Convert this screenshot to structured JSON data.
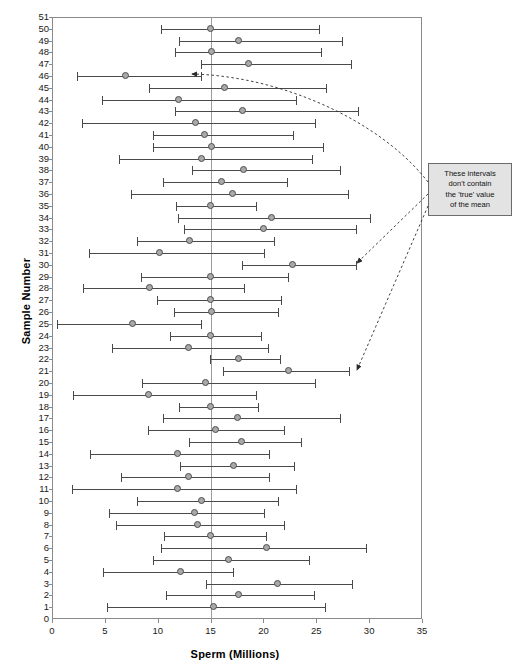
{
  "chart_data": {
    "type": "scatter",
    "title": "",
    "xlabel": "Sperm (Millions)",
    "ylabel": "Sample Number",
    "xlim": [
      0,
      35
    ],
    "ylim": [
      0,
      51
    ],
    "xticks": [
      0,
      5,
      10,
      15,
      20,
      25,
      30,
      35
    ],
    "yticks": [
      0,
      1,
      2,
      3,
      4,
      5,
      6,
      7,
      8,
      9,
      10,
      11,
      12,
      13,
      14,
      15,
      16,
      17,
      18,
      19,
      20,
      21,
      22,
      23,
      24,
      25,
      26,
      27,
      28,
      29,
      30,
      31,
      32,
      33,
      34,
      35,
      36,
      37,
      38,
      39,
      40,
      41,
      42,
      43,
      44,
      45,
      46,
      47,
      48,
      49,
      50,
      51
    ],
    "grid": false,
    "legend": null,
    "reference_line": {
      "orientation": "vertical",
      "value": 15,
      "label": "true mean"
    },
    "series": [
      {
        "name": "95% confidence interval of the mean",
        "marker": "circle",
        "points": [
          {
            "sample": 50,
            "mean": 15.0,
            "low": 10.3,
            "high": 25.3
          },
          {
            "sample": 49,
            "mean": 17.7,
            "low": 12.0,
            "high": 27.4
          },
          {
            "sample": 48,
            "mean": 15.1,
            "low": 11.6,
            "high": 25.4
          },
          {
            "sample": 47,
            "mean": 18.6,
            "low": 14.1,
            "high": 28.3
          },
          {
            "sample": 46,
            "mean": 7.0,
            "low": 2.4,
            "high": 14.1
          },
          {
            "sample": 45,
            "mean": 16.4,
            "low": 9.2,
            "high": 25.9
          },
          {
            "sample": 44,
            "mean": 12.0,
            "low": 4.7,
            "high": 23.1
          },
          {
            "sample": 43,
            "mean": 18.1,
            "low": 11.6,
            "high": 28.9
          },
          {
            "sample": 42,
            "mean": 13.6,
            "low": 2.8,
            "high": 24.9
          },
          {
            "sample": 41,
            "mean": 14.5,
            "low": 9.6,
            "high": 22.8
          },
          {
            "sample": 40,
            "mean": 15.1,
            "low": 9.6,
            "high": 25.6
          },
          {
            "sample": 39,
            "mean": 14.2,
            "low": 6.3,
            "high": 24.6
          },
          {
            "sample": 38,
            "mean": 18.2,
            "low": 13.2,
            "high": 27.2
          },
          {
            "sample": 37,
            "mean": 16.1,
            "low": 10.5,
            "high": 22.2
          },
          {
            "sample": 36,
            "mean": 17.1,
            "low": 7.5,
            "high": 28.0
          },
          {
            "sample": 35,
            "mean": 15.0,
            "low": 11.7,
            "high": 19.3
          },
          {
            "sample": 34,
            "mean": 20.8,
            "low": 11.9,
            "high": 30.1
          },
          {
            "sample": 33,
            "mean": 20.1,
            "low": 12.5,
            "high": 28.8
          },
          {
            "sample": 32,
            "mean": 13.1,
            "low": 8.0,
            "high": 21.0
          },
          {
            "sample": 31,
            "mean": 10.2,
            "low": 3.5,
            "high": 20.1
          },
          {
            "sample": 30,
            "mean": 22.8,
            "low": 18.0,
            "high": 28.8
          },
          {
            "sample": 29,
            "mean": 15.0,
            "low": 8.4,
            "high": 22.3
          },
          {
            "sample": 28,
            "mean": 9.3,
            "low": 2.9,
            "high": 18.2
          },
          {
            "sample": 27,
            "mean": 15.0,
            "low": 9.9,
            "high": 21.7
          },
          {
            "sample": 26,
            "mean": 15.1,
            "low": 11.5,
            "high": 21.4
          },
          {
            "sample": 25,
            "mean": 7.7,
            "low": 0.5,
            "high": 14.1
          },
          {
            "sample": 24,
            "mean": 15.0,
            "low": 11.2,
            "high": 19.8
          },
          {
            "sample": 23,
            "mean": 13.0,
            "low": 5.7,
            "high": 20.4
          },
          {
            "sample": 22,
            "mean": 17.7,
            "low": 14.9,
            "high": 21.6
          },
          {
            "sample": 21,
            "mean": 22.4,
            "low": 16.2,
            "high": 28.1
          },
          {
            "sample": 20,
            "mean": 14.6,
            "low": 8.5,
            "high": 24.9
          },
          {
            "sample": 19,
            "mean": 9.2,
            "low": 2.0,
            "high": 19.3
          },
          {
            "sample": 18,
            "mean": 15.0,
            "low": 12.0,
            "high": 19.5
          },
          {
            "sample": 17,
            "mean": 17.6,
            "low": 10.5,
            "high": 27.2
          },
          {
            "sample": 16,
            "mean": 15.5,
            "low": 9.1,
            "high": 21.9
          },
          {
            "sample": 15,
            "mean": 18.0,
            "low": 13.0,
            "high": 23.6
          },
          {
            "sample": 14,
            "mean": 11.9,
            "low": 3.6,
            "high": 20.5
          },
          {
            "sample": 13,
            "mean": 17.2,
            "low": 12.1,
            "high": 22.9
          },
          {
            "sample": 12,
            "mean": 13.0,
            "low": 6.5,
            "high": 20.5
          },
          {
            "sample": 11,
            "mean": 11.9,
            "low": 1.9,
            "high": 23.1
          },
          {
            "sample": 10,
            "mean": 14.2,
            "low": 8.0,
            "high": 21.4
          },
          {
            "sample": 9,
            "mean": 13.5,
            "low": 5.4,
            "high": 20.1
          },
          {
            "sample": 8,
            "mean": 13.8,
            "low": 6.1,
            "high": 21.9
          },
          {
            "sample": 7,
            "mean": 15.0,
            "low": 10.6,
            "high": 20.2
          },
          {
            "sample": 6,
            "mean": 20.3,
            "low": 10.3,
            "high": 29.7
          },
          {
            "sample": 5,
            "mean": 16.7,
            "low": 9.6,
            "high": 24.3
          },
          {
            "sample": 4,
            "mean": 12.2,
            "low": 4.8,
            "high": 17.1
          },
          {
            "sample": 3,
            "mean": 21.4,
            "low": 14.6,
            "high": 28.4
          },
          {
            "sample": 2,
            "mean": 17.7,
            "low": 10.8,
            "high": 24.8
          },
          {
            "sample": 1,
            "mean": 15.3,
            "low": 5.2,
            "high": 25.8
          }
        ]
      }
    ],
    "annotations": [
      {
        "id": "missed-intervals-note",
        "text": "These intervals don't contain the 'true' value of the mean",
        "lines": [
          "These intervals",
          "don't contain",
          "the 'true' value",
          "of the mean"
        ],
        "points_to_samples": [
          46,
          30,
          21
        ]
      }
    ]
  },
  "colors": {
    "marker_fill": "#a9a9a9",
    "marker_edge": "#4d4d4d",
    "bar": "#4a4a4a",
    "frame": "#8a8a8a",
    "reference_line": "#9b9b9b",
    "annotation_bg": "#e3e3e3",
    "annotation_border": "#6b6b6b",
    "text": "#111111"
  }
}
